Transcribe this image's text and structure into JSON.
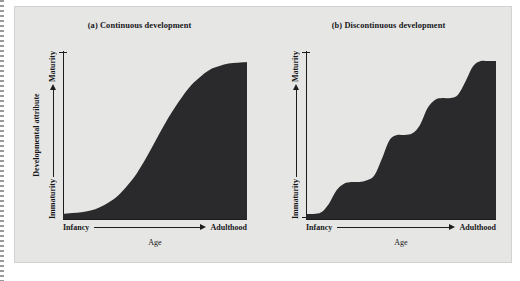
{
  "figure": {
    "background_color": "#e6e6e4",
    "page_color": "#ffffff",
    "fill_color": "#2a2a2c",
    "axis_color": "#1d1d1f"
  },
  "panels": [
    {
      "id": "continuous",
      "title": "(a) Continuous development",
      "y_axis_outer_label": "Developmental attribute",
      "y_axis_low_label": "Immaturity",
      "y_axis_high_label": "Maturity",
      "x_axis_low_label": "Infancy",
      "x_axis_high_label": "Adulthood",
      "x_axis_title": "Age"
    },
    {
      "id": "discontinuous",
      "title": "(b) Discontinuous development",
      "y_axis_outer_label": "",
      "y_axis_low_label": "Immaturity",
      "y_axis_high_label": "Maturity",
      "x_axis_low_label": "Infancy",
      "x_axis_high_label": "Adulthood",
      "x_axis_title": "Age"
    }
  ],
  "chart_data": [
    {
      "type": "area",
      "title": "(a) Continuous development",
      "xlabel": "Age",
      "ylabel": "Developmental attribute",
      "xlim": [
        0,
        100
      ],
      "ylim": [
        0,
        100
      ],
      "grid": false,
      "legend": "none",
      "x_tick_labels": [
        "Infancy",
        "Adulthood"
      ],
      "y_tick_labels": [
        "Immaturity",
        "Maturity"
      ],
      "annotations": [
        "Immaturity → Maturity",
        "Infancy → Adulthood"
      ],
      "series": [
        {
          "name": "Continuous (sigmoid) growth",
          "x": [
            0,
            5,
            10,
            15,
            20,
            25,
            30,
            35,
            40,
            45,
            50,
            55,
            60,
            65,
            70,
            75,
            80,
            85,
            90,
            95,
            100
          ],
          "values": [
            3,
            3.5,
            4,
            5,
            7,
            10,
            14,
            20,
            27,
            36,
            46,
            56,
            65,
            73,
            80,
            85,
            89,
            91,
            92.5,
            93,
            93.5
          ]
        }
      ]
    },
    {
      "type": "area",
      "title": "(b) Discontinuous development",
      "xlabel": "Age",
      "ylabel": "Immaturity – Maturity",
      "xlim": [
        0,
        100
      ],
      "ylim": [
        0,
        100
      ],
      "grid": false,
      "legend": "none",
      "x_tick_labels": [
        "Infancy",
        "Adulthood"
      ],
      "y_tick_labels": [
        "Immaturity",
        "Maturity"
      ],
      "annotations": [
        "Immaturity → Maturity",
        "Infancy → Adulthood"
      ],
      "step_plateaus": [
        3,
        22,
        50,
        72,
        94
      ],
      "series": [
        {
          "name": "Discontinuous (stage-like) growth",
          "x": [
            0,
            4,
            8,
            12,
            16,
            20,
            24,
            28,
            32,
            36,
            40,
            44,
            48,
            52,
            56,
            60,
            64,
            68,
            72,
            76,
            80,
            84,
            88,
            92,
            96,
            100
          ],
          "values": [
            3,
            3,
            4,
            9,
            17,
            21,
            22,
            22,
            23,
            26,
            36,
            47,
            50,
            50,
            51,
            56,
            66,
            71,
            72,
            72,
            74,
            82,
            91,
            94,
            94,
            94
          ]
        }
      ]
    }
  ]
}
